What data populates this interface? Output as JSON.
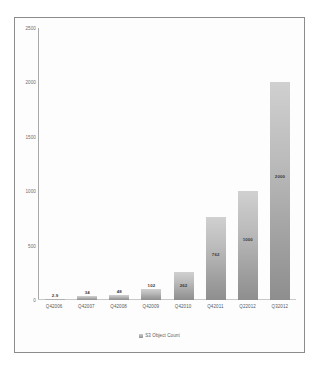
{
  "chart_data": {
    "type": "bar",
    "title": "",
    "xlabel": "",
    "ylabel": "",
    "ylim": [
      0,
      2500
    ],
    "yticks": [
      2500,
      2000,
      1500,
      1000,
      500,
      0
    ],
    "grid": false,
    "legend_position": "bottom",
    "legend": [
      "S3 Object Count"
    ],
    "categories": [
      "Q42006",
      "Q42007",
      "Q42008",
      "Q42009",
      "Q42010",
      "Q42011",
      "Q22012",
      "Q32012"
    ],
    "values": [
      2.9,
      34,
      48,
      102,
      262,
      762,
      1000,
      2000
    ],
    "value_labels": [
      "2.9",
      "34",
      "48",
      "102",
      "262",
      "762",
      "1000",
      "2000"
    ],
    "label_placement": [
      "above",
      "above",
      "above",
      "above",
      "inside",
      "inside",
      "inside",
      "inside"
    ],
    "series": [
      {
        "name": "S3 Object Count",
        "values": [
          2.9,
          34,
          48,
          102,
          262,
          762,
          1000,
          2000
        ]
      }
    ]
  },
  "legend": {
    "swatch_name": "series-color-swatch",
    "label": "S3 Object Count"
  },
  "colors": {
    "bar_top": "#d0d0d0",
    "bar_bottom": "#8e8e8e",
    "axis": "#a9a9a9",
    "frame": "#8c8c8c",
    "tick_text": "#6d6d6d",
    "value_text": "#3a3a3a",
    "background": "#ffffff"
  }
}
